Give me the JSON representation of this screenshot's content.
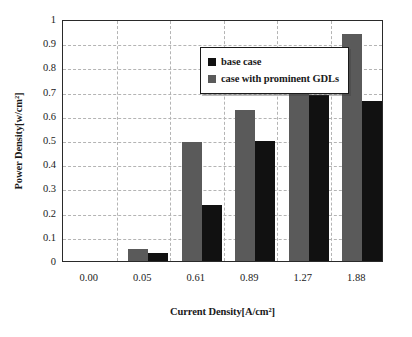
{
  "chart_data": {
    "type": "bar",
    "title": "",
    "xlabel": "Current Density[A/cm²]",
    "ylabel": "Power Density[w/cm²]",
    "categories": [
      "0.00",
      "0.05",
      "0.61",
      "0.89",
      "1.27",
      "1.88"
    ],
    "series": [
      {
        "name": "base case",
        "color": "#111111",
        "values": [
          0,
          0.035,
          0.23,
          0.495,
          0.685,
          0.66
        ]
      },
      {
        "name": "case with prominent GDLs",
        "color": "#5a5a5a",
        "values": [
          0,
          0.05,
          0.49,
          0.625,
          0.76,
          0.94
        ]
      }
    ],
    "series_draw_order": [
      "case with prominent GDLs",
      "base case"
    ],
    "ylim": [
      0,
      1
    ],
    "yticks": [
      "0",
      "0.1",
      "0.2",
      "0.3",
      "0.4",
      "0.5",
      "0.6",
      "0.7",
      "0.8",
      "0.9",
      "1"
    ],
    "ytick_values": [
      0,
      0.1,
      0.2,
      0.3,
      0.4,
      0.5,
      0.6,
      0.7,
      0.8,
      0.9,
      1
    ],
    "grid": {
      "horizontal": true,
      "vertical": true,
      "style": "dashed",
      "color": "#b4b4b4"
    },
    "legend": {
      "position": "inside-top-left",
      "entries": [
        {
          "label": "base case",
          "color": "#111111"
        },
        {
          "label": "case with prominent GDLs",
          "color": "#5a5a5a"
        }
      ]
    },
    "frame": {
      "border_color": "#2a2a2a"
    },
    "background": "#ffffff"
  }
}
